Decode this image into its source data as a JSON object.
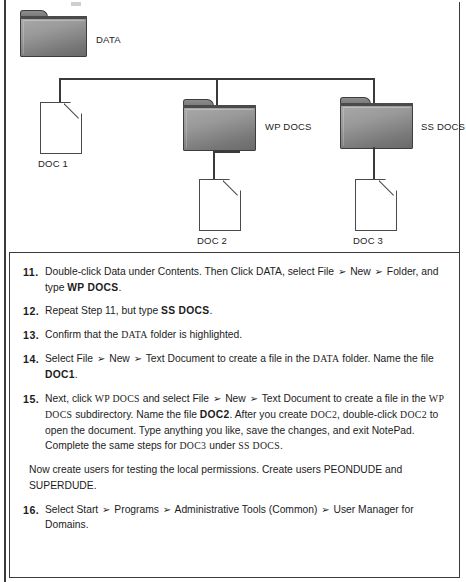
{
  "figure": {
    "nodes": [
      {
        "id": "data",
        "label": "DATA",
        "type": "folder",
        "caption_position": "right"
      },
      {
        "id": "doc1",
        "label": "DOC 1",
        "type": "document",
        "caption_position": "below"
      },
      {
        "id": "wpdocs",
        "label": "WP DOCS",
        "type": "folder",
        "caption_position": "right"
      },
      {
        "id": "ssdocs",
        "label": "SS DOCS",
        "type": "folder",
        "caption_position": "right"
      },
      {
        "id": "doc2",
        "label": "DOC 2",
        "type": "document",
        "caption_position": "below"
      },
      {
        "id": "doc3",
        "label": "DOC 3",
        "type": "document",
        "caption_position": "below"
      }
    ]
  },
  "instructions": {
    "steps": [
      {
        "number": "11.",
        "segments": [
          {
            "text": "Double-click Data under Contents. Then Click DATA, select File ",
            "style": "normal"
          },
          {
            "text": "➢",
            "style": "arrow"
          },
          {
            "text": " New ",
            "style": "normal"
          },
          {
            "text": "➢",
            "style": "arrow"
          },
          {
            "text": " Folder, and type ",
            "style": "normal"
          },
          {
            "text": "WP DOCS",
            "style": "bold"
          },
          {
            "text": ".",
            "style": "normal"
          }
        ]
      },
      {
        "number": "12.",
        "segments": [
          {
            "text": "Repeat Step 11, but type ",
            "style": "normal"
          },
          {
            "text": "SS DOCS",
            "style": "bold"
          },
          {
            "text": ".",
            "style": "normal"
          }
        ]
      },
      {
        "number": "13.",
        "segments": [
          {
            "text": "Confirm that the ",
            "style": "normal"
          },
          {
            "text": "DATA",
            "style": "mono"
          },
          {
            "text": " folder is highlighted.",
            "style": "normal"
          }
        ]
      },
      {
        "number": "14.",
        "segments": [
          {
            "text": "Select File ",
            "style": "normal"
          },
          {
            "text": "➢",
            "style": "arrow"
          },
          {
            "text": " New ",
            "style": "normal"
          },
          {
            "text": "➢",
            "style": "arrow"
          },
          {
            "text": " Text Document to create a file in the ",
            "style": "normal"
          },
          {
            "text": "DATA",
            "style": "mono"
          },
          {
            "text": " folder. Name the file ",
            "style": "normal"
          },
          {
            "text": "DOC1",
            "style": "bold"
          },
          {
            "text": ".",
            "style": "normal"
          }
        ]
      },
      {
        "number": "15.",
        "segments": [
          {
            "text": "Next, click ",
            "style": "normal"
          },
          {
            "text": "WP  DOCS",
            "style": "mono"
          },
          {
            "text": " and select File ",
            "style": "normal"
          },
          {
            "text": "➢",
            "style": "arrow"
          },
          {
            "text": " New ",
            "style": "normal"
          },
          {
            "text": "➢",
            "style": "arrow"
          },
          {
            "text": " Text Document to create a file in the ",
            "style": "normal"
          },
          {
            "text": "WP  DOCS",
            "style": "mono"
          },
          {
            "text": " subdirectory. Name the file ",
            "style": "normal"
          },
          {
            "text": "DOC2",
            "style": "bold"
          },
          {
            "text": ". After you create ",
            "style": "normal"
          },
          {
            "text": "DOC2",
            "style": "mono"
          },
          {
            "text": ", double-click ",
            "style": "normal"
          },
          {
            "text": "DOC2",
            "style": "mono"
          },
          {
            "text": " to open the document. Type anything you like, save the changes, and exit NotePad. Complete the same steps for ",
            "style": "normal"
          },
          {
            "text": "DOC3",
            "style": "mono"
          },
          {
            "text": " under ",
            "style": "normal"
          },
          {
            "text": "SS  DOCS",
            "style": "mono"
          },
          {
            "text": ".",
            "style": "normal"
          }
        ]
      }
    ],
    "paragraph": "Now create users for testing the local permissions. Create users PEONDUDE and SUPERDUDE.",
    "final_step": {
      "number": "16.",
      "segments": [
        {
          "text": "Select Start ",
          "style": "normal"
        },
        {
          "text": "➢",
          "style": "arrow"
        },
        {
          "text": " Programs ",
          "style": "normal"
        },
        {
          "text": "➢",
          "style": "arrow"
        },
        {
          "text": " Administrative Tools (Common) ",
          "style": "normal"
        },
        {
          "text": "➢",
          "style": "arrow"
        },
        {
          "text": " User Manager for Domains.",
          "style": "normal"
        }
      ]
    }
  },
  "colors": {
    "ink": "#1c1c1c",
    "rule": "#3a3a3a",
    "folder_light": "#a9a9a9",
    "folder_dark": "#6a6a6a",
    "page": "#ffffff"
  }
}
